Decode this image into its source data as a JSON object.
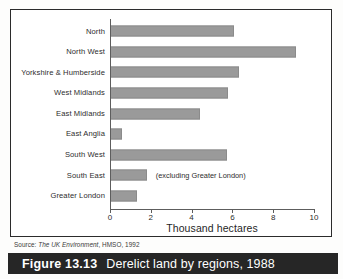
{
  "figure": {
    "caption_number": "Figure 13.13",
    "caption_text": "Derelict land by regions, 1988",
    "source_prefix": "Source:",
    "source_title": "The UK Environment",
    "source_rest": ", HMSO, 1992",
    "annotation": "(excluding Greater London)"
  },
  "colors": {
    "bar": "#9a9a9a",
    "caption_bar": "#262626",
    "axis": "#5d5d5d",
    "frame": "#2b2b2b"
  },
  "chart_data": {
    "type": "bar",
    "orientation": "horizontal",
    "title": "Derelict land by regions, 1988",
    "xlabel": "Thousand hectares",
    "ylabel": "",
    "xlim": [
      0,
      10
    ],
    "xticks": [
      0,
      2,
      4,
      6,
      8,
      10
    ],
    "xtick_labels": [
      "0",
      "2",
      "4",
      "6",
      "8",
      "10"
    ],
    "grid": false,
    "legend": false,
    "categories": [
      "North",
      "North West",
      "Yorkshire & Humberside",
      "West Midlands",
      "East Midlands",
      "East Anglia",
      "South West",
      "South East",
      "Greater London"
    ],
    "values": [
      6.1,
      9.1,
      6.3,
      5.8,
      4.4,
      0.6,
      5.75,
      1.8,
      1.3
    ],
    "annotations": [
      {
        "category": "South East",
        "text": "(excluding Greater London)"
      }
    ]
  }
}
